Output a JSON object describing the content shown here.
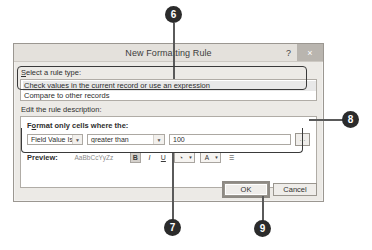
{
  "dialog": {
    "title": "New Formatting Rule",
    "help_button": "?",
    "close_button": "×",
    "rule_type": {
      "label": "Select a rule type:",
      "label_accelerator": "S",
      "items": [
        "Check values in the current record or use an expression",
        "Compare to other records"
      ],
      "selected_index": 0
    },
    "rule_description": {
      "label": "Edit the rule description:",
      "sub_label": "Format only cells where the:",
      "sub_label_accelerator": "o",
      "condition": {
        "field_select": "Field Value Is",
        "operator_select": "greater than",
        "value": "100",
        "range_button": "···"
      },
      "preview": {
        "label": "Preview:",
        "sample_text": "AaBbCcYyZz",
        "toolbar": [
          {
            "name": "bold",
            "glyph": "B",
            "state": "pressed"
          },
          {
            "name": "italic",
            "glyph": "I",
            "state": "normal"
          },
          {
            "name": "underline",
            "glyph": "U",
            "state": "normal"
          },
          {
            "name": "fill-color",
            "glyph": "◔",
            "state": "split"
          },
          {
            "name": "font-color",
            "glyph": "A",
            "state": "split"
          },
          {
            "name": "clear-format",
            "glyph": "☰",
            "state": "normal"
          }
        ]
      }
    },
    "buttons": {
      "ok": "OK",
      "cancel": "Cancel",
      "focused": "OK"
    }
  },
  "callouts": [
    {
      "number": "6",
      "position": "top"
    },
    {
      "number": "8",
      "position": "right"
    },
    {
      "number": "7",
      "position": "bottom-left"
    },
    {
      "number": "9",
      "position": "bottom-right"
    }
  ],
  "colors": {
    "callout_bg": "#2b2b2b",
    "callout_text": "#ffffff",
    "leader": "#5a5a5a",
    "dialog_bg": "#eceae6",
    "titlebar_bg": "#e4e1dc",
    "close_bg": "#b9b5af",
    "field_bg": "#ffffff",
    "border": "#9b9791",
    "annotation": "#3a3a3a"
  }
}
